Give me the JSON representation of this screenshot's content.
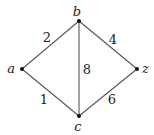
{
  "graph": {
    "nodes": [
      {
        "id": "a",
        "label": "a",
        "x": 22,
        "y": 69,
        "lx": 15,
        "ly": 73,
        "anchor": "end"
      },
      {
        "id": "b",
        "label": "b",
        "x": 79,
        "y": 21,
        "lx": 77,
        "ly": 16,
        "anchor": "middle"
      },
      {
        "id": "z",
        "label": "z",
        "x": 137,
        "y": 69,
        "lx": 142,
        "ly": 73,
        "anchor": "start"
      },
      {
        "id": "c",
        "label": "c",
        "x": 79,
        "y": 116,
        "lx": 78,
        "ly": 131,
        "anchor": "middle"
      }
    ],
    "edges": [
      {
        "from": "a",
        "to": "b",
        "weight": "2",
        "lx": 47,
        "ly": 42
      },
      {
        "from": "b",
        "to": "z",
        "weight": "4",
        "lx": 113,
        "ly": 44
      },
      {
        "from": "b",
        "to": "c",
        "weight": "8",
        "lx": 87,
        "ly": 74
      },
      {
        "from": "a",
        "to": "c",
        "weight": "1",
        "lx": 44,
        "ly": 104
      },
      {
        "from": "c",
        "to": "z",
        "weight": "6",
        "lx": 112,
        "ly": 104
      }
    ]
  }
}
